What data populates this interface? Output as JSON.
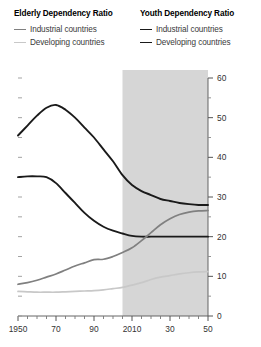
{
  "legend": {
    "groups": [
      {
        "title": "Elderly Dependency Ratio",
        "items": [
          {
            "label": "Industrial countries",
            "color": "#808080"
          },
          {
            "label": "Developing countries",
            "color": "#c8c8c8"
          }
        ]
      },
      {
        "title": "Youth Dependency Ratio",
        "items": [
          {
            "label": "Industrial countries",
            "color": "#1a1a1a"
          },
          {
            "label": "Developing countries",
            "color": "#1a1a1a"
          }
        ]
      }
    ]
  },
  "chart_data": {
    "type": "line",
    "title": "",
    "xlabel": "",
    "ylabel": "",
    "xlim": [
      1950,
      2050
    ],
    "ylim": [
      0,
      60
    ],
    "grid": false,
    "legend_position": "top",
    "y_ticks_major": [
      0,
      10,
      20,
      30,
      40,
      50,
      60
    ],
    "y_ticks_minor": [
      5,
      15,
      25,
      35,
      45,
      55
    ],
    "y_tick_labels": [
      "0",
      "10",
      "20",
      "30",
      "40",
      "50",
      "60"
    ],
    "x_ticks_major": [
      1950,
      1970,
      1990,
      2010,
      2030,
      2050
    ],
    "x_tick_labels": [
      "1950",
      "70",
      "90",
      "2010",
      "30",
      "50"
    ],
    "x_ticks_minor": [
      1955,
      1960,
      1965,
      1975,
      1980,
      1985,
      1995,
      2000,
      2005,
      2015,
      2020,
      2025,
      2035,
      2040,
      2045
    ],
    "projection_shading": {
      "from": 2005,
      "to": 2050,
      "color": "#cfcfcf",
      "label": "projection"
    },
    "x": [
      1950,
      1955,
      1960,
      1965,
      1970,
      1975,
      1980,
      1985,
      1990,
      1995,
      2000,
      2005,
      2010,
      2015,
      2020,
      2025,
      2030,
      2035,
      2040,
      2045,
      2050
    ],
    "series": [
      {
        "name": "Youth Dependency Ratio — Developing countries",
        "color": "#1a1a1a",
        "width": 1.9,
        "values": [
          45.5,
          48.0,
          50.5,
          52.5,
          53.2,
          52.0,
          50.0,
          47.5,
          45.0,
          42.0,
          39.0,
          35.5,
          33.0,
          31.5,
          30.5,
          29.5,
          29.0,
          28.5,
          28.2,
          28.0,
          28.0
        ]
      },
      {
        "name": "Youth Dependency Ratio — Industrial countries",
        "color": "#1a1a1a",
        "width": 1.9,
        "values": [
          35.0,
          35.2,
          35.2,
          35.0,
          33.5,
          31.0,
          28.5,
          26.0,
          24.0,
          22.5,
          21.5,
          20.8,
          20.2,
          20.0,
          20.0,
          20.0,
          20.0,
          20.0,
          20.0,
          20.0,
          20.0
        ]
      },
      {
        "name": "Elderly Dependency Ratio — Industrial countries",
        "color": "#808080",
        "width": 1.7,
        "values": [
          8.0,
          8.4,
          9.0,
          9.8,
          10.6,
          11.6,
          12.6,
          13.4,
          14.2,
          14.3,
          15.0,
          16.0,
          17.2,
          19.0,
          21.0,
          23.0,
          24.5,
          25.6,
          26.2,
          26.5,
          26.6
        ]
      },
      {
        "name": "Elderly Dependency Ratio — Developing countries",
        "color": "#c8c8c8",
        "width": 1.7,
        "values": [
          6.2,
          6.1,
          6.0,
          6.0,
          6.0,
          6.1,
          6.2,
          6.3,
          6.4,
          6.6,
          6.9,
          7.2,
          7.8,
          8.4,
          9.2,
          9.8,
          10.2,
          10.6,
          10.9,
          11.1,
          11.2
        ]
      }
    ]
  }
}
